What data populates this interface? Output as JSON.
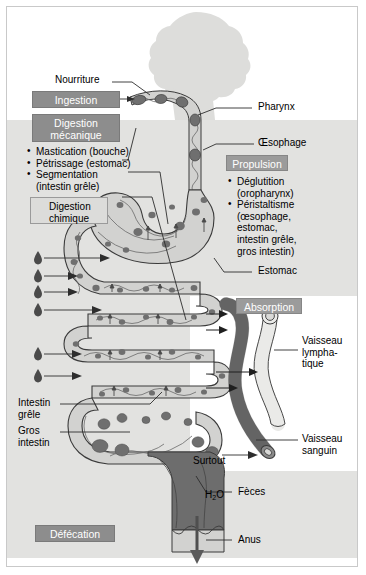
{
  "figure": {
    "type": "biology-diagram"
  },
  "stages": {
    "ingestion": {
      "label": "Ingestion"
    },
    "digestion_mecanique": {
      "label": "Digestion\nmécanique"
    },
    "digestion_chimique": {
      "label": "Digestion\nchimique",
      "icon": "droplet-icon"
    },
    "propulsion": {
      "label": "Propulsion"
    },
    "absorption": {
      "label": "Absorption"
    },
    "defecation": {
      "label": "Défécation"
    }
  },
  "mechanical_list": {
    "items": [
      {
        "text": "Mastication (bouche)"
      },
      {
        "text": "Pétrissage (estomac)"
      },
      {
        "text": "Segmentation",
        "cont": "(intestin grêle)"
      }
    ]
  },
  "propulsion_list": {
    "items": [
      {
        "text": "Déglutition",
        "cont": "(oropharynx)"
      },
      {
        "text": "Péristaltisme",
        "cont": "(œsophage,\nestomac,\nintestin grêle,\ngros intestin)"
      }
    ]
  },
  "anatomy": {
    "nourriture": "Nourriture",
    "pharynx": "Pharynx",
    "oesophage": "Œsophage",
    "estomac": "Estomac",
    "intestin_grele": "Intestin\ngrêle",
    "gros_intestin": "Gros\nintestin",
    "vaisseau_lymphatique": "Vaisseau\nlympha-\ntique",
    "vaisseau_sanguin": "Vaisseau\nsanguin",
    "feces": "Fèces",
    "anus": "Anus"
  },
  "annotations": {
    "surtout_h2o_line1": "Surtout",
    "surtout_h2o_line2_pre": "H",
    "surtout_h2o_line2_sub": "2",
    "surtout_h2o_line2_post": "O"
  },
  "colors": {
    "header_box": "#8d8d8d",
    "propulsion_box": "#9b9b9b",
    "chem_box": "#dcdcda",
    "background_tint": "#e2e2e0",
    "organ_fill": "#d2d2d0",
    "chyme_dark": "#6f6f6f",
    "blood_vessel": "#6b6b6b",
    "lymph_vessel": "#e9e9e7",
    "head_silhouette": "#dddddb",
    "outline": "#3a3a3a"
  }
}
